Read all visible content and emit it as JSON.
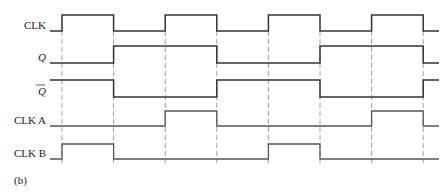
{
  "figure_label": "(b)",
  "timeline": {
    "start": 0,
    "end": 8.3,
    "edge_times": [
      1,
      2,
      3,
      4,
      5,
      6,
      7,
      8
    ],
    "dashed_guides_at": [
      1,
      2,
      3,
      4,
      5,
      6,
      7,
      8
    ]
  },
  "signals": [
    {
      "id": "clk",
      "label": "CLK",
      "italic": false,
      "overbar": false,
      "initial": 0,
      "toggles": [
        1,
        2,
        3,
        4,
        5,
        6,
        7,
        8
      ]
    },
    {
      "id": "q",
      "label": "Q",
      "italic": true,
      "overbar": false,
      "initial": 0,
      "toggles": [
        2,
        4,
        6,
        8
      ]
    },
    {
      "id": "qbar",
      "label": "Q",
      "italic": true,
      "overbar": true,
      "initial": 1,
      "toggles": [
        2,
        4,
        6,
        8
      ]
    },
    {
      "id": "clka",
      "label": "CLK A",
      "italic": false,
      "overbar": false,
      "initial": 0,
      "toggles": [
        3,
        4,
        7,
        8
      ]
    },
    {
      "id": "clkb",
      "label": "CLK B",
      "italic": false,
      "overbar": false,
      "initial": 0,
      "toggles": [
        1,
        2,
        5,
        6
      ]
    }
  ]
}
